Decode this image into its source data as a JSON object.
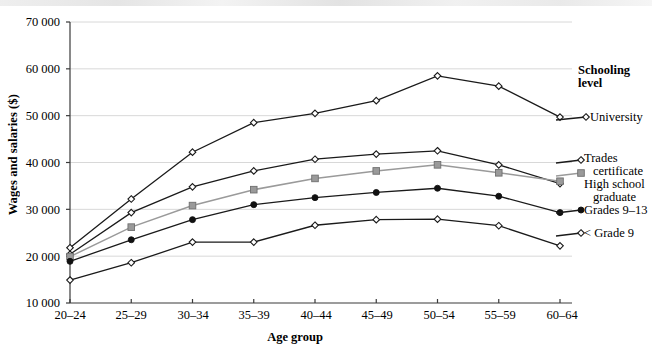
{
  "chart_data": {
    "type": "line",
    "title": "",
    "xlabel": "Age group",
    "ylabel": "Wages and salaries ($)",
    "categories": [
      "20–24",
      "25–29",
      "30–34",
      "35–39",
      "40–44",
      "45–49",
      "50–54",
      "55–59",
      "60–64"
    ],
    "ylim": [
      10000,
      70000
    ],
    "yticks": [
      10000,
      20000,
      30000,
      40000,
      50000,
      60000,
      70000
    ],
    "ytick_labels": [
      "10 000",
      "20 000",
      "30 000",
      "40 000",
      "50 000",
      "60 000",
      "70 000"
    ],
    "grid": "horizontal",
    "legend_position": "right",
    "legend_title": "Schooling level",
    "series": [
      {
        "name": "University",
        "marker": "diamond-open",
        "color": "#1a1a1a",
        "values": [
          21800,
          32200,
          42200,
          48500,
          50500,
          53200,
          58500,
          56300,
          49700
        ]
      },
      {
        "name": "Trades certificate",
        "marker": "diamond-open",
        "color": "#1a1a1a",
        "values": [
          20400,
          29300,
          34800,
          38200,
          40700,
          41800,
          42500,
          39500,
          35500
        ]
      },
      {
        "name": "High school graduate",
        "marker": "square-filled",
        "color": "#9a9a9a",
        "values": [
          19900,
          26200,
          30800,
          34200,
          36600,
          38200,
          39500,
          37800,
          36000
        ]
      },
      {
        "name": "Grades 9–13",
        "marker": "circle-filled",
        "color": "#1a1a1a",
        "values": [
          18900,
          23500,
          27800,
          31000,
          32500,
          33600,
          34500,
          32800,
          29300
        ]
      },
      {
        "name": "< Grade 9",
        "marker": "diamond-open",
        "color": "#1a1a1a",
        "values": [
          14900,
          18600,
          23000,
          23000,
          26600,
          27800,
          27900,
          26500,
          22200
        ]
      }
    ]
  },
  "legend": {
    "title_line1": "Schooling",
    "title_line2": "level",
    "items": [
      {
        "label": "University"
      },
      {
        "label": "Trades"
      },
      {
        "label": "certificate"
      },
      {
        "label": "High school"
      },
      {
        "label": "graduate"
      },
      {
        "label": "Grades 9–13"
      },
      {
        "label": "< Grade 9"
      }
    ]
  }
}
